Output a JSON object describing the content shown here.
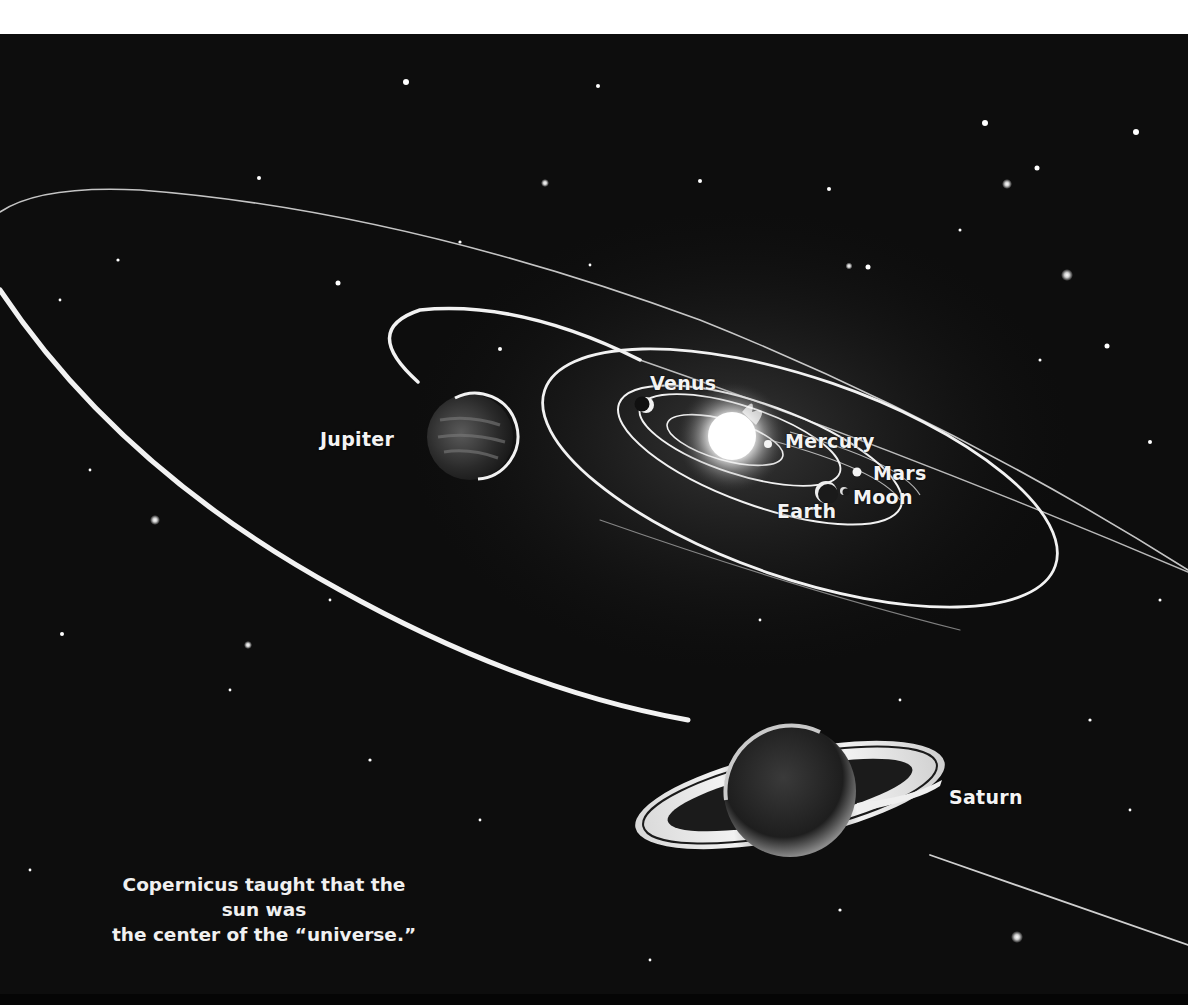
{
  "illustration": {
    "title": "Copernican model of the solar system",
    "background_color": "#0d0d0d",
    "orbit_color": "#f2f2f2",
    "caption": {
      "line1": "Copernicus taught that the sun was",
      "line2": "the center of the “universe.”"
    },
    "bodies": [
      {
        "name": "Sun",
        "label": ""
      },
      {
        "name": "Mercury",
        "label": "Mercury"
      },
      {
        "name": "Venus",
        "label": "Venus"
      },
      {
        "name": "Earth",
        "label": "Earth"
      },
      {
        "name": "Moon",
        "label": "Moon"
      },
      {
        "name": "Mars",
        "label": "Mars"
      },
      {
        "name": "Jupiter",
        "label": "Jupiter"
      },
      {
        "name": "Saturn",
        "label": "Saturn"
      }
    ]
  }
}
